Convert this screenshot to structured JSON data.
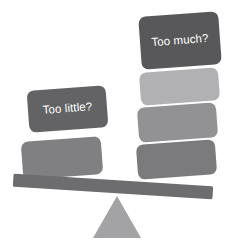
{
  "illustration": {
    "title": "Balance scale seesaw with block stacks",
    "background_color": "#ffffff"
  },
  "beam": {
    "name": "balance-beam",
    "color": "#6d6d6f",
    "rotation_deg": 3.6
  },
  "fulcrum": {
    "name": "fulcrum-triangle",
    "color": "#a3a3a5"
  },
  "left_stack": {
    "label": "Too little?",
    "label_color": "#ffffff",
    "blocks": [
      {
        "name": "left-label-block",
        "color": "#636365",
        "label": "Too little?"
      },
      {
        "name": "left-block-2",
        "color": "#808082",
        "label": ""
      }
    ]
  },
  "right_stack": {
    "label": "Too much?",
    "label_color": "#ffffff",
    "blocks": [
      {
        "name": "right-label-block",
        "color": "#58585a",
        "label": "Too much?"
      },
      {
        "name": "right-block-2",
        "color": "#b1b1b3",
        "label": ""
      },
      {
        "name": "right-block-3",
        "color": "#929294",
        "label": ""
      },
      {
        "name": "right-block-4",
        "color": "#7b7b7d",
        "label": ""
      }
    ]
  }
}
